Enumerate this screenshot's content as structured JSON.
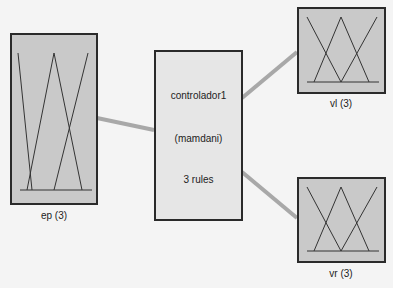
{
  "diagram": {
    "inputs": [
      {
        "name": "ep",
        "label": "ep (3)",
        "mf_count": 3
      }
    ],
    "controller": {
      "name": "controlador1",
      "type": "(mamdani)",
      "rules": "3 rules"
    },
    "outputs": [
      {
        "name": "vl",
        "label": "vl (3)",
        "mf_count": 3
      },
      {
        "name": "vr",
        "label": "vr (3)",
        "mf_count": 3
      }
    ],
    "colors": {
      "background": "#f4f4f4",
      "var_fill": "#c9c9c9",
      "ctrl_fill": "#e6e6e6",
      "border": "#2a2a2a",
      "connector": "#a8a8a8"
    }
  }
}
